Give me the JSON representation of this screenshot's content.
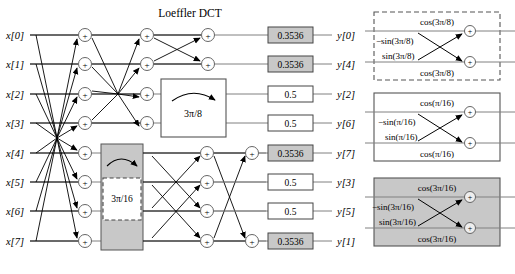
{
  "figure": {
    "title": "Loeffler DCT",
    "type": "signal-flow-graph"
  },
  "inputs": [
    {
      "label": "x[0]"
    },
    {
      "label": "x[1]"
    },
    {
      "label": "x[2]"
    },
    {
      "label": "x[3]"
    },
    {
      "label": "x[4]"
    },
    {
      "label": "x[5]"
    },
    {
      "label": "x[6]"
    },
    {
      "label": "x[7]"
    }
  ],
  "outputs": [
    {
      "label": "y[0]",
      "scale": "0.3536",
      "fill": "#c8c8c8"
    },
    {
      "label": "y[4]",
      "scale": "0.3536",
      "fill": "#c8c8c8"
    },
    {
      "label": "y[2]",
      "scale": "0.5",
      "fill": "#ffffff"
    },
    {
      "label": "y[6]",
      "scale": "0.5",
      "fill": "#ffffff"
    },
    {
      "label": "y[7]",
      "scale": "0.3536",
      "fill": "#c8c8c8"
    },
    {
      "label": "y[3]",
      "scale": "0.5",
      "fill": "#ffffff"
    },
    {
      "label": "y[5]",
      "scale": "0.5",
      "fill": "#ffffff"
    },
    {
      "label": "y[1]",
      "scale": "0.3536",
      "fill": "#c8c8c8"
    }
  ],
  "rotations": [
    {
      "name": "rotation-block-3pi-8",
      "label": "3π/8",
      "fill": "#ffffff",
      "border": "solid"
    },
    {
      "name": "rotation-block-3pi-16",
      "label": "3π/16",
      "fill": "#c8c8c8",
      "border": "solid",
      "inner_fill": "#ffffff",
      "inner_border": "dashed"
    }
  ],
  "adder_symbol": "+",
  "legend": [
    {
      "name": "legend-rot-3pi-8",
      "border": "dashed",
      "fill": "#ffffff",
      "top_coeff": "cos(3π/8)",
      "upper_cross_coeff": "−sin(3π/8)",
      "lower_cross_coeff": "sin(3π/8)",
      "bottom_coeff": "cos(3π/8)"
    },
    {
      "name": "legend-rot-pi-16",
      "border": "solid",
      "fill": "#ffffff",
      "top_coeff": "cos(π/16)",
      "upper_cross_coeff": "−sin(π/16)",
      "lower_cross_coeff": "sin(π/16)",
      "bottom_coeff": "cos(π/16)"
    },
    {
      "name": "legend-rot-3pi-16",
      "border": "solid",
      "fill": "#c8c8c8",
      "top_coeff": "cos(3π/16)",
      "upper_cross_coeff": "−sin(3π/16)",
      "lower_cross_coeff": "sin(3π/16)",
      "bottom_coeff": "cos(3π/16)"
    }
  ]
}
